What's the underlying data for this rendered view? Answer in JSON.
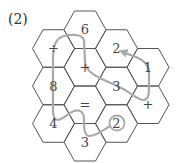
{
  "problem_label": "(2)",
  "colors": {
    "grid": "#555555",
    "path": "#aaaaaa",
    "text": "#444444"
  },
  "cells": [
    {
      "col": 1,
      "row": 0,
      "text": "6"
    },
    {
      "col": 0,
      "row": 0,
      "text": "÷"
    },
    {
      "col": 1,
      "row": 1,
      "text": "+"
    },
    {
      "col": 2,
      "row": 0,
      "text": "2"
    },
    {
      "col": 3,
      "row": 0,
      "text": "1"
    },
    {
      "col": 0,
      "row": 1,
      "text": "8"
    },
    {
      "col": 2,
      "row": 1,
      "text": "3"
    },
    {
      "col": 1,
      "row": 2,
      "text": "="
    },
    {
      "col": 3,
      "row": 1,
      "text": "+"
    },
    {
      "col": 0,
      "row": 2,
      "text": "4"
    },
    {
      "col": 2,
      "row": 2,
      "text": "2",
      "circled": true
    },
    {
      "col": 1,
      "row": 3,
      "text": "3"
    }
  ],
  "path_description": "Gray path starting at circled 2, through 3, =, 4, 8, ÷, 6, +, 3, +, 1, ending with arrow at 2"
}
